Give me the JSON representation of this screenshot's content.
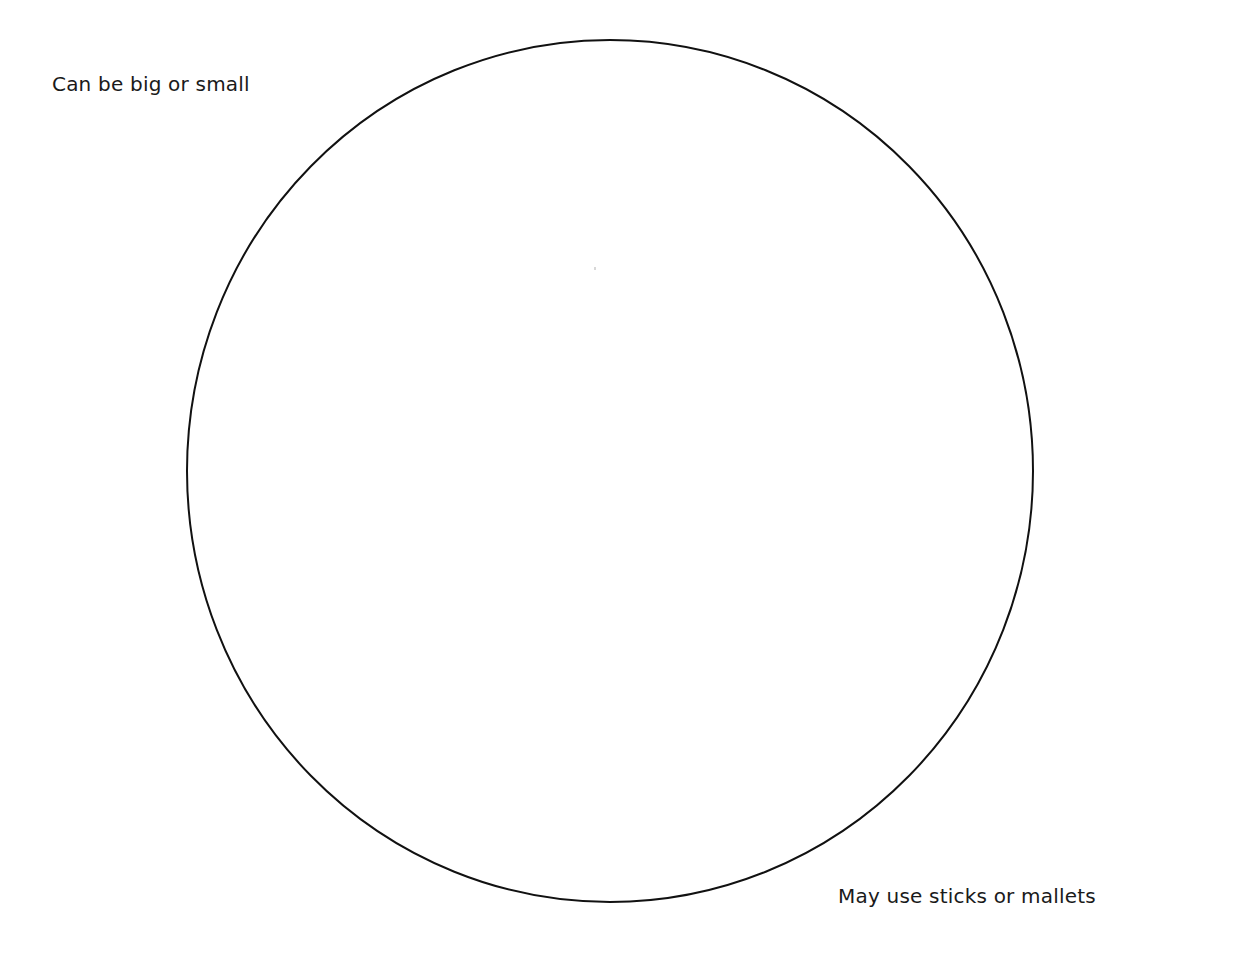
{
  "diagram": {
    "type": "single-circle",
    "circle": {
      "cx": 610,
      "cy": 471,
      "rx": 423,
      "ry": 431,
      "stroke": "#111111",
      "fill": "#ffffff",
      "stroke_width": 2
    },
    "labels": {
      "top_left": "Can be big or small",
      "bottom_right": "May use sticks or mallets"
    }
  }
}
